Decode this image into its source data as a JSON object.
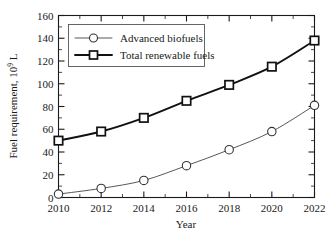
{
  "chart_data": {
    "type": "line",
    "title": "",
    "xlabel": "Year",
    "ylabel": "Fuel requirement, 10⁹ L",
    "ylabel_main": "Fuel requirement, 10",
    "ylabel_exp": "9",
    "ylabel_unit": " L",
    "x": [
      2010,
      2012,
      2014,
      2016,
      2018,
      2020,
      2022
    ],
    "xtick_labels": [
      "2010",
      "2012",
      "2014",
      "2016",
      "2018",
      "2020",
      "2022"
    ],
    "ytick_labels": [
      "0",
      "20",
      "40",
      "60",
      "80",
      "100",
      "120",
      "140",
      "160"
    ],
    "yticks": [
      0,
      20,
      40,
      60,
      80,
      100,
      120,
      140,
      160
    ],
    "xlim": [
      2010,
      2022
    ],
    "ylim": [
      0,
      160
    ],
    "grid": false,
    "minor_ticks": true,
    "legend_position": "upper-left",
    "series": [
      {
        "name": "Advanced biofuels",
        "marker": "circle",
        "values": [
          3,
          8,
          15,
          28,
          42,
          58,
          81
        ]
      },
      {
        "name": "Total renewable fuels",
        "marker": "square",
        "values": [
          50,
          58,
          70,
          85,
          99,
          115,
          138
        ]
      }
    ]
  },
  "legend": {
    "items": [
      {
        "label": "Advanced biofuels",
        "marker": "circle-marker"
      },
      {
        "label": "Total renewable fuels",
        "marker": "square-marker"
      }
    ]
  },
  "axes": {
    "x_title": "Year",
    "y_title_main": "Fuel requirement, 10",
    "y_title_exp": "9",
    "y_title_unit": " L"
  },
  "colors": {
    "axis": "#1a1a1a",
    "series_total": "#111111",
    "series_advanced": "#444444",
    "background": "#ffffff"
  }
}
